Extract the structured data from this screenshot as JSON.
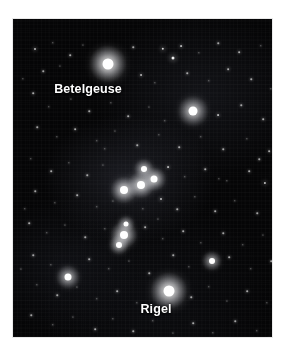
{
  "image": {
    "subject": "Orion constellation night sky photograph",
    "background_color": "#ffffff",
    "sky_color": "#050506",
    "label_color": "#ffffff",
    "frame": {
      "x": 13,
      "y": 19,
      "width": 259,
      "height": 318
    }
  },
  "labels": [
    {
      "id": "betelgeuse",
      "text": "Betelgeuse",
      "x": 75,
      "y": 70,
      "font_size": 12.5
    },
    {
      "id": "rigel",
      "text": "Rigel",
      "x": 143,
      "y": 290,
      "font_size": 12.5
    }
  ],
  "named_stars": [
    {
      "name": "Betelgeuse",
      "x": 95,
      "y": 45,
      "size": 11,
      "brightness": 1.0
    },
    {
      "name": "Bellatrix",
      "x": 180,
      "y": 92,
      "size": 9,
      "brightness": 0.82
    },
    {
      "name": "Rigel",
      "x": 156,
      "y": 272,
      "size": 11,
      "brightness": 1.0
    },
    {
      "name": "Saiph",
      "x": 55,
      "y": 258,
      "size": 7,
      "brightness": 0.72
    },
    {
      "name": "Alnitak",
      "x": 111,
      "y": 171,
      "size": 8,
      "brightness": 0.88
    },
    {
      "name": "Alnilam",
      "x": 128,
      "y": 166,
      "size": 8,
      "brightness": 0.9
    },
    {
      "name": "Mintaka",
      "x": 141,
      "y": 160,
      "size": 7,
      "brightness": 0.85
    },
    {
      "name": "Meissa",
      "x": 131,
      "y": 150,
      "size": 6,
      "brightness": 0.7
    },
    {
      "name": "Orion Nebula",
      "x": 111,
      "y": 216,
      "size": 8,
      "brightness": 0.85
    },
    {
      "name": "Sword Upper",
      "x": 113,
      "y": 205,
      "size": 5,
      "brightness": 0.6
    },
    {
      "name": "Sword Lower",
      "x": 106,
      "y": 226,
      "size": 6,
      "brightness": 0.7
    },
    {
      "name": "Eta Orionis",
      "x": 199,
      "y": 242,
      "size": 6,
      "brightness": 0.62
    }
  ],
  "field_stars": [
    {
      "x": 22,
      "y": 30,
      "s": 2.0
    },
    {
      "x": 40,
      "y": 24,
      "s": 1.4
    },
    {
      "x": 57,
      "y": 36,
      "s": 1.6
    },
    {
      "x": 70,
      "y": 26,
      "s": 1.2
    },
    {
      "x": 120,
      "y": 28,
      "s": 1.5
    },
    {
      "x": 150,
      "y": 30,
      "s": 2.4
    },
    {
      "x": 160,
      "y": 39,
      "s": 3.0
    },
    {
      "x": 168,
      "y": 27,
      "s": 1.8
    },
    {
      "x": 186,
      "y": 34,
      "s": 1.3
    },
    {
      "x": 205,
      "y": 24,
      "s": 1.5
    },
    {
      "x": 226,
      "y": 33,
      "s": 1.7
    },
    {
      "x": 248,
      "y": 27,
      "s": 1.4
    },
    {
      "x": 262,
      "y": 41,
      "s": 1.6
    },
    {
      "x": 30,
      "y": 52,
      "s": 1.5
    },
    {
      "x": 47,
      "y": 47,
      "s": 1.2
    },
    {
      "x": 128,
      "y": 56,
      "s": 1.9
    },
    {
      "x": 142,
      "y": 64,
      "s": 1.3
    },
    {
      "x": 174,
      "y": 54,
      "s": 1.5
    },
    {
      "x": 196,
      "y": 62,
      "s": 1.4
    },
    {
      "x": 215,
      "y": 50,
      "s": 1.7
    },
    {
      "x": 238,
      "y": 60,
      "s": 1.5
    },
    {
      "x": 258,
      "y": 70,
      "s": 1.3
    },
    {
      "x": 20,
      "y": 74,
      "s": 1.6
    },
    {
      "x": 36,
      "y": 88,
      "s": 1.4
    },
    {
      "x": 58,
      "y": 80,
      "s": 1.2
    },
    {
      "x": 76,
      "y": 92,
      "s": 1.5
    },
    {
      "x": 98,
      "y": 84,
      "s": 1.3
    },
    {
      "x": 115,
      "y": 97,
      "s": 1.6
    },
    {
      "x": 136,
      "y": 88,
      "s": 1.2
    },
    {
      "x": 152,
      "y": 102,
      "s": 1.4
    },
    {
      "x": 205,
      "y": 96,
      "s": 1.8
    },
    {
      "x": 228,
      "y": 86,
      "s": 1.5
    },
    {
      "x": 250,
      "y": 100,
      "s": 1.6
    },
    {
      "x": 24,
      "y": 108,
      "s": 1.5
    },
    {
      "x": 44,
      "y": 118,
      "s": 1.3
    },
    {
      "x": 62,
      "y": 110,
      "s": 1.7
    },
    {
      "x": 84,
      "y": 122,
      "s": 1.4
    },
    {
      "x": 102,
      "y": 112,
      "s": 1.2
    },
    {
      "x": 124,
      "y": 126,
      "s": 1.5
    },
    {
      "x": 146,
      "y": 116,
      "s": 1.3
    },
    {
      "x": 166,
      "y": 128,
      "s": 1.6
    },
    {
      "x": 188,
      "y": 118,
      "s": 1.4
    },
    {
      "x": 210,
      "y": 130,
      "s": 1.5
    },
    {
      "x": 234,
      "y": 120,
      "s": 1.3
    },
    {
      "x": 256,
      "y": 132,
      "s": 1.7
    },
    {
      "x": 18,
      "y": 140,
      "s": 1.4
    },
    {
      "x": 38,
      "y": 152,
      "s": 1.6
    },
    {
      "x": 56,
      "y": 144,
      "s": 1.3
    },
    {
      "x": 74,
      "y": 156,
      "s": 1.5
    },
    {
      "x": 90,
      "y": 146,
      "s": 1.2
    },
    {
      "x": 155,
      "y": 148,
      "s": 1.8
    },
    {
      "x": 172,
      "y": 158,
      "s": 1.4
    },
    {
      "x": 192,
      "y": 150,
      "s": 1.5
    },
    {
      "x": 214,
      "y": 162,
      "s": 1.3
    },
    {
      "x": 236,
      "y": 152,
      "s": 1.6
    },
    {
      "x": 252,
      "y": 164,
      "s": 2.2
    },
    {
      "x": 264,
      "y": 156,
      "s": 1.5
    },
    {
      "x": 22,
      "y": 172,
      "s": 1.5
    },
    {
      "x": 42,
      "y": 184,
      "s": 1.3
    },
    {
      "x": 64,
      "y": 176,
      "s": 1.6
    },
    {
      "x": 84,
      "y": 188,
      "s": 1.4
    },
    {
      "x": 100,
      "y": 182,
      "s": 1.2
    },
    {
      "x": 148,
      "y": 180,
      "s": 2.0
    },
    {
      "x": 164,
      "y": 190,
      "s": 1.5
    },
    {
      "x": 182,
      "y": 178,
      "s": 1.3
    },
    {
      "x": 202,
      "y": 192,
      "s": 1.6
    },
    {
      "x": 222,
      "y": 182,
      "s": 1.4
    },
    {
      "x": 244,
      "y": 194,
      "s": 1.5
    },
    {
      "x": 262,
      "y": 186,
      "s": 1.3
    },
    {
      "x": 16,
      "y": 204,
      "s": 1.6
    },
    {
      "x": 34,
      "y": 214,
      "s": 1.4
    },
    {
      "x": 52,
      "y": 206,
      "s": 1.2
    },
    {
      "x": 72,
      "y": 218,
      "s": 1.5
    },
    {
      "x": 92,
      "y": 210,
      "s": 1.3
    },
    {
      "x": 132,
      "y": 208,
      "s": 1.7
    },
    {
      "x": 150,
      "y": 220,
      "s": 1.4
    },
    {
      "x": 170,
      "y": 212,
      "s": 1.6
    },
    {
      "x": 188,
      "y": 224,
      "s": 1.3
    },
    {
      "x": 210,
      "y": 214,
      "s": 1.5
    },
    {
      "x": 230,
      "y": 226,
      "s": 1.4
    },
    {
      "x": 250,
      "y": 216,
      "s": 1.2
    },
    {
      "x": 20,
      "y": 236,
      "s": 1.5
    },
    {
      "x": 38,
      "y": 246,
      "s": 1.3
    },
    {
      "x": 76,
      "y": 240,
      "s": 1.6
    },
    {
      "x": 96,
      "y": 250,
      "s": 1.4
    },
    {
      "x": 116,
      "y": 242,
      "s": 1.2
    },
    {
      "x": 136,
      "y": 254,
      "s": 1.5
    },
    {
      "x": 176,
      "y": 248,
      "s": 1.3
    },
    {
      "x": 216,
      "y": 238,
      "s": 1.6
    },
    {
      "x": 238,
      "y": 250,
      "s": 1.4
    },
    {
      "x": 258,
      "y": 242,
      "s": 1.5
    },
    {
      "x": 24,
      "y": 266,
      "s": 1.3
    },
    {
      "x": 44,
      "y": 276,
      "s": 1.5
    },
    {
      "x": 64,
      "y": 268,
      "s": 1.2
    },
    {
      "x": 84,
      "y": 280,
      "s": 1.4
    },
    {
      "x": 104,
      "y": 272,
      "s": 1.6
    },
    {
      "x": 124,
      "y": 284,
      "s": 1.3
    },
    {
      "x": 178,
      "y": 278,
      "s": 1.5
    },
    {
      "x": 196,
      "y": 268,
      "s": 1.4
    },
    {
      "x": 214,
      "y": 282,
      "s": 1.2
    },
    {
      "x": 234,
      "y": 272,
      "s": 1.6
    },
    {
      "x": 254,
      "y": 284,
      "s": 1.3
    },
    {
      "x": 18,
      "y": 296,
      "s": 1.5
    },
    {
      "x": 40,
      "y": 306,
      "s": 1.4
    },
    {
      "x": 60,
      "y": 298,
      "s": 1.2
    },
    {
      "x": 82,
      "y": 310,
      "s": 1.6
    },
    {
      "x": 100,
      "y": 300,
      "s": 1.3
    },
    {
      "x": 120,
      "y": 312,
      "s": 1.5
    },
    {
      "x": 140,
      "y": 302,
      "s": 1.4
    },
    {
      "x": 160,
      "y": 314,
      "s": 1.2
    },
    {
      "x": 180,
      "y": 304,
      "s": 1.6
    },
    {
      "x": 200,
      "y": 314,
      "s": 1.3
    },
    {
      "x": 222,
      "y": 302,
      "s": 1.5
    },
    {
      "x": 244,
      "y": 312,
      "s": 1.4
    },
    {
      "x": 30,
      "y": 322,
      "s": 1.3
    },
    {
      "x": 70,
      "y": 328,
      "s": 1.5
    },
    {
      "x": 110,
      "y": 324,
      "s": 1.4
    },
    {
      "x": 150,
      "y": 330,
      "s": 1.2
    },
    {
      "x": 190,
      "y": 326,
      "s": 1.6
    },
    {
      "x": 230,
      "y": 330,
      "s": 1.3
    },
    {
      "x": 256,
      "y": 320,
      "s": 1.5
    },
    {
      "x": 10,
      "y": 60,
      "s": 1.3
    },
    {
      "x": 12,
      "y": 190,
      "s": 1.4
    },
    {
      "x": 8,
      "y": 250,
      "s": 1.2
    },
    {
      "x": 268,
      "y": 110,
      "s": 1.4
    },
    {
      "x": 270,
      "y": 220,
      "s": 1.3
    },
    {
      "x": 246,
      "y": 140,
      "s": 1.5
    },
    {
      "x": 206,
      "y": 160,
      "s": 1.3
    },
    {
      "x": 92,
      "y": 130,
      "s": 1.4
    },
    {
      "x": 160,
      "y": 236,
      "s": 1.5
    },
    {
      "x": 130,
      "y": 190,
      "s": 1.3
    },
    {
      "x": 145,
      "y": 200,
      "s": 1.2
    }
  ]
}
